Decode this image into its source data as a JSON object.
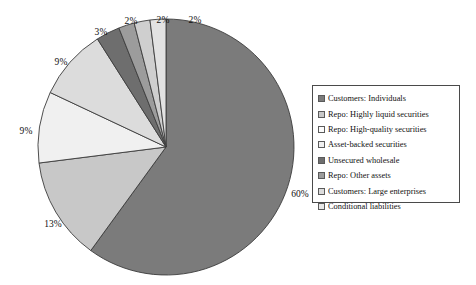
{
  "chart_data": {
    "type": "pie",
    "title": "",
    "subtitle": "",
    "xlabel": "",
    "ylabel": "",
    "legend_position": "right",
    "grid": false,
    "categories": [
      "Customers: Individuals",
      "Repo: Highly liquid securities",
      "Repo: High-quality securities",
      "Asset-backed securities",
      "Unsecured wholesale",
      "Repo: Other assets",
      "Customers: Large enterprises",
      "Conditional liabilities"
    ],
    "values": [
      60,
      13,
      9,
      9,
      3,
      2,
      2,
      2
    ],
    "value_labels": [
      "60%",
      "13%",
      "9%",
      "9%",
      "3%",
      "2%",
      "2%",
      "2%"
    ],
    "colors": [
      "#7b7b7b",
      "#c8c8c8",
      "#f0f0f0",
      "#dcdcdc",
      "#6e6e6e",
      "#9c9c9c",
      "#cfcfcf",
      "#e2e2e2"
    ],
    "slice_border_color": "#3c3c3c",
    "start_angle_deg": 0,
    "direction": "clockwise",
    "total": 100
  },
  "legend": {
    "items": [
      {
        "label": "Customers: Individuals",
        "color": "#7b7b7b"
      },
      {
        "label": "Repo: Highly liquid securities",
        "color": "#c8c8c8"
      },
      {
        "label": "Repo: High-quality securities",
        "color": "#fbfbfb"
      },
      {
        "label": "Asset-backed securities",
        "color": "#f0f0f0"
      },
      {
        "label": "Unsecured wholesale",
        "color": "#6e6e6e"
      },
      {
        "label": "Repo: Other assets",
        "color": "#9c9c9c"
      },
      {
        "label": "Customers: Large enterprises",
        "color": "#dcdcdc"
      },
      {
        "label": "Conditional liabilities",
        "color": "#e8e8e8"
      }
    ]
  },
  "labels": {
    "p60": "60%",
    "p13": "13%",
    "p9a": "9%",
    "p9b": "9%",
    "p3": "3%",
    "p2a": "2%",
    "p2b": "2%",
    "p2c": "2%"
  }
}
